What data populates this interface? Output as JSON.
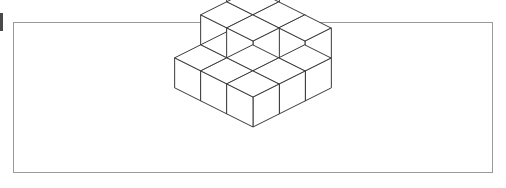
{
  "page": {
    "width": 506,
    "height": 188,
    "background_color": "#ffffff"
  },
  "border": {
    "label": "figure border rectangle",
    "x": 13,
    "y": 22,
    "width": 479,
    "height": 150,
    "stroke_color": "#9a9a9a",
    "stroke_width": 1,
    "fill": "none"
  },
  "artifact": {
    "label": "scan edge mark",
    "x": 0,
    "y": 13,
    "width": 3,
    "height": 18,
    "color": "#4a4a4a"
  },
  "figure": {
    "name": "isometric-cube-stack",
    "origin_x": 253,
    "origin_y": 49,
    "half_width": 26,
    "half_depth": 13,
    "cube_height": 30,
    "line_color": "#3a3a3a",
    "face_color": "#ffffff",
    "line_width": 1,
    "total_cubes": 15,
    "bounds": {
      "left": 177,
      "right": 329,
      "top": 34,
      "bottom": 163
    },
    "cubes": [
      {
        "x": 0,
        "y": 0,
        "z": 0
      },
      {
        "x": 1,
        "y": 0,
        "z": 0
      },
      {
        "x": 2,
        "y": 0,
        "z": 0
      },
      {
        "x": 0,
        "y": 1,
        "z": 0
      },
      {
        "x": 1,
        "y": 1,
        "z": 0
      },
      {
        "x": 2,
        "y": 1,
        "z": 0
      },
      {
        "x": 0,
        "y": 2,
        "z": 0
      },
      {
        "x": 1,
        "y": 2,
        "z": 0
      },
      {
        "x": 2,
        "y": 2,
        "z": 0
      },
      {
        "x": 0,
        "y": 0,
        "z": 1
      },
      {
        "x": 1,
        "y": 0,
        "z": 1
      },
      {
        "x": 2,
        "y": 0,
        "z": 1
      },
      {
        "x": 0,
        "y": 1,
        "z": 1
      },
      {
        "x": 1,
        "y": 1,
        "z": 1
      },
      {
        "x": 0,
        "y": 0,
        "z": 2
      }
    ]
  }
}
